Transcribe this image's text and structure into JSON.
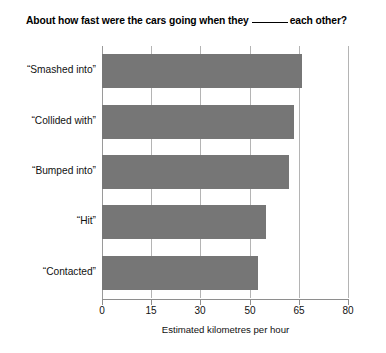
{
  "chart_data": {
    "type": "bar",
    "orientation": "horizontal",
    "title_prefix": "About how fast were the cars going when they",
    "title_suffix": "each other?",
    "title_has_blank": true,
    "categories": [
      "“Smashed into”",
      "“Collided with”",
      "“Bumped into”",
      "“Hit”",
      "“Contacted”"
    ],
    "values": [
      66,
      63.5,
      62,
      55,
      52.5
    ],
    "xlabel": "Estimated kilometres per hour",
    "ylabel": "",
    "xticks": [
      0,
      15,
      30,
      50,
      65,
      80
    ],
    "xtick_labels": [
      "0",
      "15",
      "30",
      "50",
      "65",
      "80"
    ],
    "xlim": [
      0,
      80
    ],
    "grid": "vertical",
    "legend": null,
    "bar_color": "#767676",
    "axis_color": "#8e8e8e",
    "gridline_color": "#b4b4b4",
    "background_color": "#ffffff"
  }
}
